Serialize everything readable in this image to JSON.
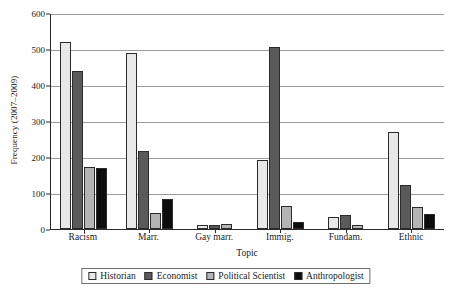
{
  "chart_data": {
    "type": "bar",
    "title": "",
    "xlabel": "Topic",
    "ylabel": "Frequency (2007–2009)",
    "ylim": [
      0,
      600
    ],
    "yticks": [
      0,
      100,
      200,
      300,
      400,
      500,
      600
    ],
    "grid": true,
    "legend_position": "bottom",
    "categories": [
      "Racism",
      "Marr.",
      "Gay marr.",
      "Immig.",
      "Fundam.",
      "Ethnic"
    ],
    "series": [
      {
        "name": "Historian",
        "color": "#e8e8e8",
        "values": [
          520,
          490,
          12,
          193,
          33,
          270
        ]
      },
      {
        "name": "Economist",
        "color": "#5a5a5a",
        "values": [
          440,
          216,
          11,
          505,
          40,
          122
        ]
      },
      {
        "name": "Political Scientist",
        "color": "#b4b4b4",
        "values": [
          173,
          44,
          15,
          64,
          11,
          60
        ]
      },
      {
        "name": "Anthropologist",
        "color": "#0d0d0d",
        "values": [
          169,
          82,
          0,
          20,
          0,
          43
        ]
      }
    ]
  }
}
